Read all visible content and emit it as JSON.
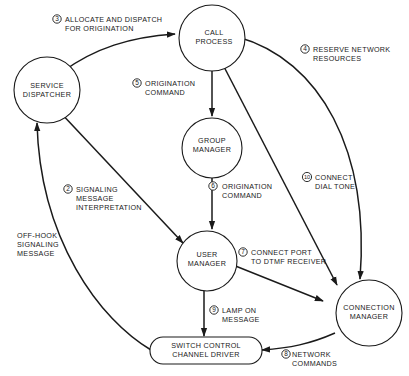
{
  "nodes": {
    "service_dispatcher": {
      "line1": "SERVICE",
      "line2": "DISPATCHER"
    },
    "call_process": {
      "line1": "CALL",
      "line2": "PROCESS"
    },
    "group_manager": {
      "line1": "GROUP",
      "line2": "MANAGER"
    },
    "user_manager": {
      "line1": "USER",
      "line2": "MANAGER"
    },
    "connection_manager": {
      "line1": "CONNECTION",
      "line2": "MANAGER"
    },
    "switch_control": {
      "line1": "SWITCH CONTROL",
      "line2": "CHANNEL DRIVER"
    }
  },
  "edges": {
    "off_hook": {
      "step": "",
      "line1": "OFF-HOOK",
      "line2": "SIGNALING",
      "line3": "MESSAGE"
    },
    "signaling": {
      "step": "2",
      "line1": "SIGNALING",
      "line2": "MESSAGE",
      "line3": "INTERPRETATION"
    },
    "allocate": {
      "step": "3",
      "line1": "ALLOCATE AND DISPATCH",
      "line2": "FOR ORIGINATION"
    },
    "reserve": {
      "step": "4",
      "line1": "RESERVE NETWORK",
      "line2": "RESOURCES"
    },
    "origination_5": {
      "step": "5",
      "line1": "ORIGINATION",
      "line2": "COMMAND"
    },
    "origination_6": {
      "step": "6",
      "line1": "ORIGINATION",
      "line2": "COMMAND"
    },
    "connect_port": {
      "step": "7",
      "line1": "CONNECT PORT",
      "line2": "TO DTMF RECEIVER"
    },
    "network_commands": {
      "step": "8",
      "line1": "NETWORK",
      "line2": "COMMANDS"
    },
    "lamp_on": {
      "step": "9",
      "line1": "LAMP ON",
      "line2": "MESSAGE"
    },
    "dial_tone": {
      "step": "10",
      "line1": "CONNECT",
      "line2": "DIAL TONE"
    }
  },
  "colors": {
    "ink": "#1a1a1a",
    "background": "#ffffff"
  }
}
